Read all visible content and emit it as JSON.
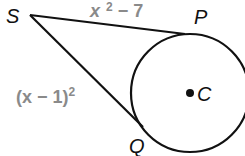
{
  "diagram": {
    "type": "tangent-segments-to-circle",
    "points": {
      "S": {
        "label": "S"
      },
      "P": {
        "label": "P"
      },
      "Q": {
        "label": "Q"
      },
      "C": {
        "label": "C"
      }
    },
    "segments": {
      "SP": {
        "expr_base": "x",
        "expr_sup": "2",
        "expr_rest": " − 7"
      },
      "SQ": {
        "expr_base": "(x − 1)",
        "expr_sup": "2"
      }
    },
    "colors": {
      "line": "#111111",
      "expression": "#8a8a8a"
    }
  }
}
